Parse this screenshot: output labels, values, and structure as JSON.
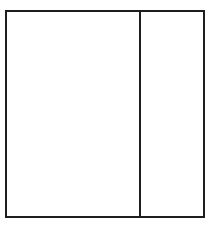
{
  "diagram": {
    "type": "two-panel-rectangle",
    "stroke_color": "#1e1e1e",
    "background_color": "#ffffff",
    "panels": [
      {
        "id": "left",
        "label": ""
      },
      {
        "id": "right",
        "label": ""
      }
    ]
  }
}
